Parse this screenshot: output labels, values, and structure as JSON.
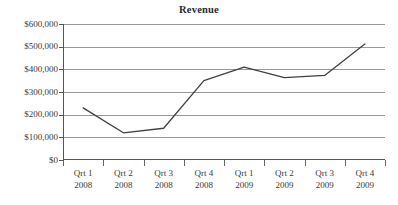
{
  "chart_data": {
    "type": "line",
    "title": "Revenue",
    "xlabel": "",
    "ylabel": "",
    "categories": [
      "Qrt 1 2008",
      "Qrt 2 2008",
      "Qrt 3 2008",
      "Qrt 4 2008",
      "Qrt 1 2009",
      "Qrt 2 2009",
      "Qrt 3 2009",
      "Qrt 4 2009"
    ],
    "category_lines": [
      [
        "Qrt 1",
        "2008"
      ],
      [
        "Qrt 2",
        "2008"
      ],
      [
        "Qrt 3",
        "2008"
      ],
      [
        "Qrt 4",
        "2008"
      ],
      [
        "Qrt 1",
        "2009"
      ],
      [
        "Qrt 2",
        "2009"
      ],
      [
        "Qrt 3",
        "2009"
      ],
      [
        "Qrt 4",
        "2009"
      ]
    ],
    "values": [
      230000,
      120000,
      140000,
      350000,
      410000,
      363000,
      373000,
      512000
    ],
    "ylim": [
      0,
      600000
    ],
    "ytick_values": [
      0,
      100000,
      200000,
      300000,
      400000,
      500000,
      600000
    ],
    "ytick_labels": [
      "$0",
      "$100,000",
      "$200,000",
      "$300,000",
      "$400,000",
      "$500,000",
      "$600,000"
    ],
    "grid": "horizontal",
    "legend": "none",
    "series": [
      {
        "name": "Revenue",
        "color": "#404040",
        "values": [
          230000,
          120000,
          140000,
          350000,
          410000,
          363000,
          373000,
          512000
        ]
      }
    ]
  },
  "colors": {
    "background": "#ffffff",
    "grid": "#9a9a9a",
    "axis": "#555555",
    "series": "#404040",
    "text": "#3a3a3a",
    "title": "#2b2b2b"
  }
}
